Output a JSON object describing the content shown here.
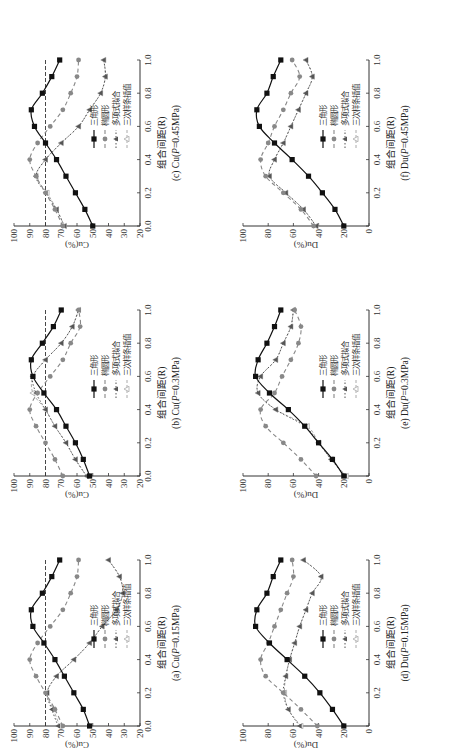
{
  "figure": {
    "x_label": "组合间距(R)",
    "legend": [
      "三角形",
      "椭圆形",
      "多项式拟合",
      "三次样条插值"
    ],
    "colors": {
      "triangle": "#111111",
      "ellipse": "#888888",
      "poly": "#555555",
      "spline": "#aaaaaa",
      "reference": "#333333"
    }
  },
  "chart_data": [
    {
      "id": "a",
      "type": "line",
      "title": "(a) Cu(P=0.15MPa)",
      "caption_prefix": "(a) Cu(",
      "caption_p": "P",
      "caption_suffix": "=0.15MPa)",
      "xlabel": "组合间距(R)",
      "ylabel": "Cu(%)",
      "x": [
        0.0,
        0.1,
        0.2,
        0.3,
        0.4,
        0.5,
        0.6,
        0.7,
        0.8,
        0.9,
        1.0
      ],
      "xticks": [
        "0.0",
        "0.2",
        "0.4",
        "0.6",
        "0.8",
        "1.0"
      ],
      "ylim": [
        20,
        100
      ],
      "yticks": [
        "20",
        "30",
        "40",
        "50",
        "60",
        "70",
        "80",
        "90",
        "100"
      ],
      "reference_line": 80,
      "series": [
        {
          "name": "三角形",
          "values": [
            52,
            56,
            62,
            68,
            74,
            81,
            88,
            89,
            82,
            76,
            71
          ]
        },
        {
          "name": "椭圆形",
          "values": [
            69,
            74,
            80,
            86,
            90,
            85,
            77,
            69,
            64,
            60,
            59
          ]
        },
        {
          "name": "多项式拟合",
          "values": [
            72,
            76,
            79,
            73,
            62,
            52,
            44,
            35,
            31,
            33,
            40
          ]
        },
        {
          "name": "三次样条插值",
          "values": [
            71,
            75,
            79,
            73,
            62,
            52,
            44,
            35,
            31,
            33,
            40
          ]
        }
      ]
    },
    {
      "id": "b",
      "type": "line",
      "title": "(b) Cu(P=0.3MPa)",
      "caption_prefix": "(b) Cu(",
      "caption_p": "P",
      "caption_suffix": "=0.3MPa)",
      "xlabel": "组合间距(R)",
      "ylabel": "Cu(%)",
      "x": [
        0.0,
        0.1,
        0.2,
        0.3,
        0.4,
        0.5,
        0.6,
        0.7,
        0.8,
        0.9,
        1.0
      ],
      "xticks": [
        "0.0",
        "0.2",
        "0.4",
        "0.6",
        "0.8",
        "1.0"
      ],
      "ylim": [
        20,
        100
      ],
      "yticks": [
        "20",
        "30",
        "40",
        "50",
        "60",
        "70",
        "80",
        "90",
        "100"
      ],
      "reference_line": 80,
      "series": [
        {
          "name": "三角形",
          "values": [
            52,
            56,
            61,
            67,
            73,
            81,
            88,
            89,
            82,
            75,
            70
          ]
        },
        {
          "name": "椭圆形",
          "values": [
            69,
            74,
            80,
            86,
            90,
            85,
            77,
            69,
            64,
            58,
            59
          ]
        },
        {
          "name": "多项式拟合",
          "values": [
            54,
            61,
            67,
            74,
            80,
            86,
            88,
            80,
            70,
            63,
            59
          ]
        },
        {
          "name": "三次样条插值",
          "values": [
            54,
            61,
            67,
            74,
            80,
            88,
            88,
            80,
            70,
            63,
            59
          ]
        }
      ]
    },
    {
      "id": "c",
      "type": "line",
      "title": "(c) Cu(P=0.45MPa)",
      "caption_prefix": "(c) Cu(",
      "caption_p": "P",
      "caption_suffix": "=0.45MPa)",
      "xlabel": "组合间距(R)",
      "ylabel": "Cu(%)",
      "x": [
        0.0,
        0.1,
        0.2,
        0.3,
        0.4,
        0.5,
        0.6,
        0.7,
        0.8,
        0.9,
        1.0
      ],
      "xticks": [
        "0.0",
        "0.2",
        "0.4",
        "0.6",
        "0.8",
        "1.0"
      ],
      "ylim": [
        20,
        100
      ],
      "yticks": [
        "20",
        "30",
        "40",
        "50",
        "60",
        "70",
        "80",
        "90",
        "100"
      ],
      "reference_line": 80,
      "series": [
        {
          "name": "三角形",
          "values": [
            50,
            55,
            61,
            67,
            73,
            80,
            87,
            89,
            82,
            76,
            71
          ]
        },
        {
          "name": "椭圆形",
          "values": [
            69,
            74,
            80,
            86,
            90,
            85,
            77,
            69,
            64,
            60,
            59
          ]
        },
        {
          "name": "多项式拟合",
          "values": [
            68,
            73,
            80,
            86,
            80,
            70,
            59,
            52,
            45,
            42,
            43
          ]
        },
        {
          "name": "三次样条插值",
          "values": [
            68,
            73,
            79,
            86,
            80,
            70,
            59,
            52,
            45,
            42,
            43
          ]
        }
      ]
    },
    {
      "id": "d",
      "type": "line",
      "title": "(d) Du(P=0.15MPa)",
      "caption_prefix": "(d) Du(",
      "caption_p": "P",
      "caption_suffix": "=0.15MPa)",
      "xlabel": "组合间距(R)",
      "ylabel": "Du(%)",
      "x": [
        0.0,
        0.1,
        0.2,
        0.3,
        0.4,
        0.5,
        0.6,
        0.7,
        0.8,
        0.9,
        1.0
      ],
      "xticks": [
        "",
        "0.2",
        "0.4",
        "0.6",
        "0.8",
        "1.0"
      ],
      "ylim": [
        0,
        100
      ],
      "yticks": [
        "0",
        "20",
        "40",
        "60",
        "80",
        "100"
      ],
      "reference_line": null,
      "series": [
        {
          "name": "三角形",
          "values": [
            20,
            29,
            39,
            51,
            65,
            79,
            90,
            89,
            81,
            76,
            70
          ]
        },
        {
          "name": "椭圆形",
          "values": [
            41,
            54,
            68,
            82,
            86,
            80,
            75,
            70,
            65,
            60,
            61
          ]
        },
        {
          "name": "多项式拟合",
          "values": [
            55,
            64,
            68,
            66,
            63,
            59,
            55,
            50,
            45,
            38,
            52
          ]
        },
        {
          "name": "三次样条插值",
          "values": [
            54,
            64,
            67,
            66,
            63,
            59,
            55,
            50,
            45,
            38,
            52
          ]
        }
      ]
    },
    {
      "id": "e",
      "type": "line",
      "title": "(e) Du(P=0.3MPa)",
      "caption_prefix": "(e) Du(",
      "caption_p": "P",
      "caption_suffix": "=0.3MPa)",
      "xlabel": "组合间距(R)",
      "ylabel": "Du(%)",
      "x": [
        0.0,
        0.1,
        0.2,
        0.3,
        0.4,
        0.5,
        0.6,
        0.7,
        0.8,
        0.9,
        1.0
      ],
      "xticks": [
        "",
        "0.2",
        "0.4",
        "0.6",
        "0.8",
        "1.0"
      ],
      "ylim": [
        0,
        100
      ],
      "yticks": [
        "0",
        "20",
        "40",
        "60",
        "80",
        "100"
      ],
      "reference_line": null,
      "series": [
        {
          "name": "三角形",
          "values": [
            20,
            29,
            40,
            51,
            64,
            79,
            90,
            88,
            81,
            75,
            70
          ]
        },
        {
          "name": "椭圆形",
          "values": [
            42,
            54,
            68,
            82,
            86,
            75,
            69,
            62,
            56,
            54,
            59
          ]
        },
        {
          "name": "多项式拟合",
          "values": [
            19,
            30,
            40,
            51,
            74,
            88,
            86,
            74,
            68,
            62,
            60
          ]
        },
        {
          "name": "三次样条插值",
          "values": [
            18,
            30,
            40,
            49,
            74,
            88,
            86,
            74,
            68,
            62,
            60
          ]
        }
      ]
    },
    {
      "id": "f",
      "type": "line",
      "title": "(f) Du(P=0.45MPa)",
      "caption_prefix": "(f) Du(",
      "caption_p": "P",
      "caption_suffix": "=0.45MPa)",
      "xlabel": "组合间距(R)",
      "ylabel": "Du(%)",
      "x": [
        0.0,
        0.1,
        0.2,
        0.3,
        0.4,
        0.5,
        0.6,
        0.7,
        0.8,
        0.9,
        1.0
      ],
      "xticks": [
        "",
        "0.2",
        "0.4",
        "0.6",
        "0.8",
        "1.0"
      ],
      "ylim": [
        0,
        100
      ],
      "yticks": [
        "0",
        "20",
        "40",
        "60",
        "80",
        "100"
      ],
      "reference_line": null,
      "series": [
        {
          "name": "三角形",
          "values": [
            20,
            27,
            37,
            48,
            61,
            75,
            87,
            89,
            81,
            76,
            70
          ]
        },
        {
          "name": "椭圆形",
          "values": [
            44,
            54,
            68,
            82,
            86,
            80,
            75,
            68,
            62,
            55,
            61
          ]
        },
        {
          "name": "多项式拟合",
          "values": [
            42,
            52,
            66,
            79,
            75,
            68,
            62,
            56,
            50,
            45,
            50
          ]
        },
        {
          "name": "三次样条插值",
          "values": [
            42,
            52,
            66,
            79,
            75,
            68,
            62,
            56,
            50,
            45,
            50
          ]
        }
      ]
    }
  ]
}
